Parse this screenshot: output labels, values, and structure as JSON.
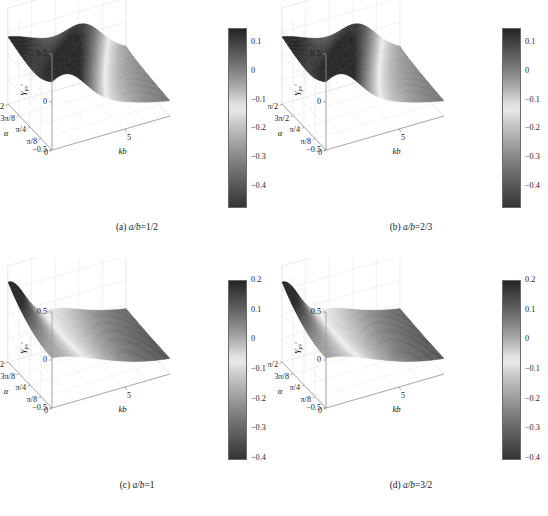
{
  "figure": {
    "panels": [
      {
        "id": "a",
        "caption_tag": "(a)",
        "caption_expr": "a/b",
        "caption_eq": "=1/2",
        "caption_full": "(a) a/b=1/2",
        "zlabel_base": "Y",
        "zlabel_sub": "pv",
        "zlabel_prime": "′",
        "xlabel": "kb",
        "ylabel": "α",
        "z_ticks": [
          "0.5",
          "0",
          "−0.5"
        ],
        "alpha_ticks": [
          "π/2",
          "3π/8",
          "π/4",
          "π/8",
          "0"
        ],
        "kb_ticks": [
          "5"
        ],
        "cbar_ticks": [
          "0.1",
          "0",
          "−0.1",
          "−0.2",
          "−0.3",
          "−0.4"
        ],
        "cbar_max": 0.15,
        "cbar_min": -0.47,
        "surface": "ridge"
      },
      {
        "id": "b",
        "caption_tag": "(b)",
        "caption_expr": "a/b",
        "caption_eq": "=2/3",
        "caption_full": "(b) a/b=2/3",
        "zlabel_base": "Y",
        "zlabel_sub": "pv",
        "zlabel_prime": "′",
        "xlabel": "kb",
        "ylabel": "α",
        "z_ticks": [
          "0.5",
          "0",
          "−0.5"
        ],
        "alpha_ticks": [
          "π/2",
          "3π/2",
          "π/4",
          "π/8",
          "0"
        ],
        "kb_ticks": [
          "5"
        ],
        "cbar_ticks": [
          "0.1",
          "0",
          "−0.1",
          "−0.2",
          "−0.3",
          "−0.4"
        ],
        "cbar_max": 0.15,
        "cbar_min": -0.47,
        "surface": "ridge"
      },
      {
        "id": "c",
        "caption_tag": "(c)",
        "caption_expr": "a/b",
        "caption_eq": "=1",
        "caption_full": "(c) a/b=1",
        "zlabel_base": "Y",
        "zlabel_sub": "pv",
        "zlabel_prime": "′",
        "xlabel": "kb",
        "ylabel": "α",
        "z_ticks": [
          "0.5",
          "0",
          "−0.5"
        ],
        "alpha_ticks": [
          "π/2",
          "3π/8",
          "π/4",
          "π/8",
          "0"
        ],
        "kb_ticks": [
          "5"
        ],
        "cbar_ticks": [
          "0.2",
          "0.1",
          "0",
          "−0.1",
          "−0.2",
          "−0.3",
          "−0.4"
        ],
        "cbar_max": 0.2,
        "cbar_min": -0.4,
        "surface": "peak"
      },
      {
        "id": "d",
        "caption_tag": "(d)",
        "caption_expr": "a/b",
        "caption_eq": "=3/2",
        "caption_full": "(d) a/b=3/2",
        "zlabel_base": "Y",
        "zlabel_sub": "pv",
        "zlabel_prime": "′",
        "xlabel": "kb",
        "ylabel": "α",
        "z_ticks": [
          "0.5",
          "0",
          "−0.5"
        ],
        "alpha_ticks": [
          "π/2",
          "3π/8",
          "π/4",
          "π/8",
          "0"
        ],
        "kb_ticks": [
          "5"
        ],
        "cbar_ticks": [
          "0.2",
          "0.1",
          "0",
          "−0.1",
          "−0.2",
          "−0.3",
          "−0.4"
        ],
        "cbar_max": 0.2,
        "cbar_min": -0.4,
        "surface": "peak"
      }
    ]
  },
  "chart_data": [
    {
      "type": "heatmap",
      "panel": "a",
      "title": "(a) a/b=1/2",
      "xlabel": "kb",
      "ylabel": "α",
      "zlabel": "Y_pv′",
      "xlim": [
        0,
        8
      ],
      "ylim": [
        0,
        1.5707963
      ],
      "zlim": [
        -0.5,
        0.5
      ],
      "xtick_labels": [
        "5"
      ],
      "ytick_labels": [
        "0",
        "π/8",
        "π/4",
        "3π/8",
        "π/2"
      ],
      "ztick_labels": [
        "−0.5",
        "0",
        "0.5"
      ],
      "colorbar": {
        "ticks": [
          0.1,
          0,
          -0.1,
          -0.2,
          -0.3,
          -0.4
        ],
        "vmin": -0.47,
        "vmax": 0.15,
        "cmap": "gray"
      },
      "grid": true,
      "description": "Surface of Y_pv' over kb and alpha; broad light diagonal ridge band running from lower-left to upper-right separating darker regions, surface descends toward large kb.",
      "z_values": [
        [
          0.05,
          -0.02,
          -0.12,
          -0.22,
          -0.3,
          -0.36,
          -0.4,
          -0.43,
          -0.45
        ],
        [
          0.06,
          0.0,
          -0.09,
          -0.18,
          -0.26,
          -0.33,
          -0.38,
          -0.41,
          -0.44
        ],
        [
          0.08,
          0.02,
          -0.05,
          -0.13,
          -0.21,
          -0.28,
          -0.34,
          -0.39,
          -0.42
        ],
        [
          0.1,
          0.05,
          -0.01,
          -0.08,
          -0.16,
          -0.23,
          -0.3,
          -0.35,
          -0.4
        ],
        [
          0.12,
          0.07,
          0.02,
          -0.04,
          -0.11,
          -0.18,
          -0.26,
          -0.32,
          -0.38
        ],
        [
          0.13,
          0.09,
          0.04,
          -0.01,
          -0.07,
          -0.14,
          -0.22,
          -0.29,
          -0.36
        ],
        [
          0.14,
          0.1,
          0.06,
          0.01,
          -0.04,
          -0.11,
          -0.19,
          -0.27,
          -0.34
        ],
        [
          0.15,
          0.11,
          0.07,
          0.02,
          -0.03,
          -0.09,
          -0.17,
          -0.25,
          -0.33
        ],
        [
          0.15,
          0.12,
          0.08,
          0.03,
          -0.02,
          -0.08,
          -0.16,
          -0.24,
          -0.32
        ]
      ]
    },
    {
      "type": "heatmap",
      "panel": "b",
      "title": "(b) a/b=2/3",
      "xlabel": "kb",
      "ylabel": "α",
      "zlabel": "Y_pv′",
      "xlim": [
        0,
        8
      ],
      "ylim": [
        0,
        1.5707963
      ],
      "zlim": [
        -0.5,
        0.5
      ],
      "xtick_labels": [
        "5"
      ],
      "ytick_labels": [
        "0",
        "π/8",
        "π/4",
        "3π/2",
        "π/2"
      ],
      "ztick_labels": [
        "−0.5",
        "0",
        "0.5"
      ],
      "colorbar": {
        "ticks": [
          0.1,
          0,
          -0.1,
          -0.2,
          -0.3,
          -0.4
        ],
        "vmin": -0.47,
        "vmax": 0.15,
        "cmap": "gray"
      },
      "grid": true,
      "description": "Surface similar to (a) with a light diagonal ridge; darker lobe toward large kb and small alpha.",
      "z_values": [
        [
          0.04,
          -0.03,
          -0.13,
          -0.23,
          -0.31,
          -0.37,
          -0.41,
          -0.44,
          -0.46
        ],
        [
          0.06,
          -0.01,
          -0.1,
          -0.19,
          -0.27,
          -0.34,
          -0.39,
          -0.42,
          -0.45
        ],
        [
          0.08,
          0.02,
          -0.06,
          -0.14,
          -0.22,
          -0.29,
          -0.35,
          -0.4,
          -0.43
        ],
        [
          0.1,
          0.05,
          -0.02,
          -0.09,
          -0.17,
          -0.24,
          -0.31,
          -0.36,
          -0.41
        ],
        [
          0.12,
          0.07,
          0.02,
          -0.05,
          -0.12,
          -0.19,
          -0.27,
          -0.33,
          -0.39
        ],
        [
          0.13,
          0.09,
          0.04,
          -0.01,
          -0.08,
          -0.15,
          -0.23,
          -0.3,
          -0.37
        ],
        [
          0.14,
          0.1,
          0.06,
          0.01,
          -0.05,
          -0.12,
          -0.2,
          -0.28,
          -0.35
        ],
        [
          0.15,
          0.11,
          0.07,
          0.02,
          -0.03,
          -0.1,
          -0.18,
          -0.26,
          -0.34
        ],
        [
          0.15,
          0.12,
          0.08,
          0.03,
          -0.02,
          -0.09,
          -0.17,
          -0.25,
          -0.33
        ]
      ]
    },
    {
      "type": "heatmap",
      "panel": "c",
      "title": "(c) a/b=1",
      "xlabel": "kb",
      "ylabel": "α",
      "zlabel": "Y_pv′",
      "xlim": [
        0,
        8
      ],
      "ylim": [
        0,
        1.5707963
      ],
      "zlim": [
        -0.5,
        0.5
      ],
      "xtick_labels": [
        "5"
      ],
      "ytick_labels": [
        "0",
        "π/8",
        "π/4",
        "3π/8",
        "π/2"
      ],
      "ztick_labels": [
        "−0.5",
        "0",
        "0.5"
      ],
      "colorbar": {
        "ticks": [
          0.2,
          0.1,
          0,
          -0.1,
          -0.2,
          -0.3,
          -0.4
        ],
        "vmin": -0.4,
        "vmax": 0.2,
        "cmap": "gray"
      },
      "grid": true,
      "description": "Surface with a sharp dark peak at small kb and large alpha, a light valley trough adjacent, then a broad dark basin extending to large kb.",
      "z_values": [
        [
          0.02,
          -0.06,
          -0.16,
          -0.25,
          -0.31,
          -0.35,
          -0.38,
          -0.39,
          -0.4
        ],
        [
          0.04,
          -0.03,
          -0.12,
          -0.21,
          -0.28,
          -0.33,
          -0.36,
          -0.38,
          -0.39
        ],
        [
          0.07,
          0.0,
          -0.08,
          -0.17,
          -0.24,
          -0.3,
          -0.34,
          -0.37,
          -0.38
        ],
        [
          0.11,
          0.03,
          -0.04,
          -0.12,
          -0.2,
          -0.27,
          -0.32,
          -0.35,
          -0.37
        ],
        [
          0.15,
          0.06,
          -0.01,
          -0.08,
          -0.16,
          -0.23,
          -0.29,
          -0.33,
          -0.36
        ],
        [
          0.18,
          0.08,
          0.01,
          -0.05,
          -0.12,
          -0.19,
          -0.26,
          -0.31,
          -0.35
        ],
        [
          0.2,
          0.09,
          0.02,
          -0.03,
          -0.09,
          -0.16,
          -0.23,
          -0.29,
          -0.34
        ],
        [
          0.2,
          0.09,
          0.02,
          -0.02,
          -0.08,
          -0.14,
          -0.21,
          -0.28,
          -0.33
        ],
        [
          0.19,
          0.08,
          0.01,
          -0.02,
          -0.07,
          -0.13,
          -0.2,
          -0.27,
          -0.33
        ]
      ]
    },
    {
      "type": "heatmap",
      "panel": "d",
      "title": "(d) a/b=3/2",
      "xlabel": "kb",
      "ylabel": "α",
      "zlabel": "Y_pv′",
      "xlim": [
        0,
        8
      ],
      "ylim": [
        0,
        1.5707963
      ],
      "zlim": [
        -0.5,
        0.5
      ],
      "xtick_labels": [
        "5"
      ],
      "ytick_labels": [
        "0",
        "π/8",
        "π/4",
        "3π/8",
        "π/2"
      ],
      "ztick_labels": [
        "−0.5",
        "0",
        "0.5"
      ],
      "colorbar": {
        "ticks": [
          0.2,
          0.1,
          0,
          -0.1,
          -0.2,
          -0.3,
          -0.4
        ],
        "vmin": -0.4,
        "vmax": 0.2,
        "cmap": "gray"
      },
      "grid": true,
      "description": "Similar to (c): dark peak at small kb / large alpha with adjacent light trough and wide dark basin at large kb.",
      "z_values": [
        [
          0.02,
          -0.06,
          -0.16,
          -0.25,
          -0.31,
          -0.35,
          -0.38,
          -0.39,
          -0.4
        ],
        [
          0.05,
          -0.03,
          -0.12,
          -0.21,
          -0.28,
          -0.33,
          -0.36,
          -0.38,
          -0.39
        ],
        [
          0.08,
          0.0,
          -0.08,
          -0.16,
          -0.24,
          -0.3,
          -0.34,
          -0.37,
          -0.38
        ],
        [
          0.12,
          0.03,
          -0.04,
          -0.12,
          -0.19,
          -0.26,
          -0.32,
          -0.35,
          -0.37
        ],
        [
          0.16,
          0.06,
          -0.01,
          -0.07,
          -0.15,
          -0.22,
          -0.29,
          -0.33,
          -0.36
        ],
        [
          0.19,
          0.08,
          0.01,
          -0.04,
          -0.11,
          -0.18,
          -0.25,
          -0.31,
          -0.35
        ],
        [
          0.2,
          0.09,
          0.02,
          -0.02,
          -0.08,
          -0.15,
          -0.22,
          -0.29,
          -0.34
        ],
        [
          0.2,
          0.09,
          0.02,
          -0.02,
          -0.07,
          -0.13,
          -0.21,
          -0.28,
          -0.33
        ],
        [
          0.19,
          0.08,
          0.01,
          -0.02,
          -0.07,
          -0.12,
          -0.2,
          -0.27,
          -0.33
        ]
      ]
    }
  ]
}
